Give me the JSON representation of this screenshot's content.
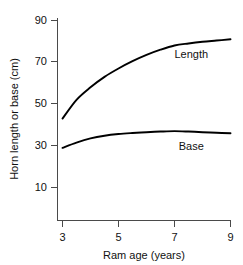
{
  "chart_data": {
    "type": "line",
    "title": "",
    "xlabel": "Ram age (years)",
    "ylabel": "Horn length or base (cm)",
    "xlim": [
      3,
      9
    ],
    "ylim": [
      10,
      90
    ],
    "xticks": [
      "3",
      "5",
      "7",
      "9"
    ],
    "xtick_values": [
      3,
      5,
      7,
      9
    ],
    "yticks": [
      "90",
      "70",
      "50",
      "30",
      "10"
    ],
    "ytick_values": [
      90,
      70,
      50,
      30,
      10
    ],
    "grid": false,
    "legend_position": "inline-annotation",
    "x": [
      3,
      3.5,
      4,
      4.5,
      5,
      5.5,
      6,
      6.5,
      7,
      7.5,
      8,
      8.5,
      9
    ],
    "series": [
      {
        "name": "Length",
        "label": "Length",
        "color": "#000000",
        "values": [
          43,
          52,
          58,
          63,
          67,
          70.5,
          73.5,
          76,
          78,
          79,
          79.8,
          80.4,
          81
        ]
      },
      {
        "name": "Base",
        "label": "Base",
        "color": "#000000",
        "values": [
          29,
          31.5,
          33.5,
          34.8,
          35.6,
          36.1,
          36.5,
          36.8,
          37,
          36.8,
          36.5,
          36.2,
          36
        ]
      }
    ],
    "annotations": [
      {
        "text": "Length",
        "x": 7.6,
        "y": 72,
        "series": "Length"
      },
      {
        "text": "Base",
        "x": 7.6,
        "y": 28,
        "series": "Base"
      }
    ]
  }
}
